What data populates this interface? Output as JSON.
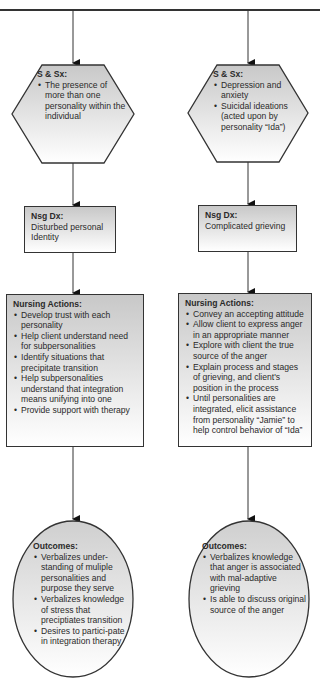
{
  "diagram": {
    "type": "flowchart",
    "columns": [
      {
        "id": "left",
        "symptoms": {
          "title": "S & Sx:",
          "items": [
            "The presence of more than one personality within the individual"
          ]
        },
        "diagnosis": {
          "title": "Nsg Dx:",
          "text": "Disturbed personal Identity"
        },
        "actions": {
          "title": "Nursing Actions:",
          "items": [
            "Develop trust with each personality",
            "Help client understand need for subpersonalities",
            "Identify situations that precipitate transition",
            "Help subpersonalities understand that integration means unifying into one",
            "Provide support with therapy"
          ]
        },
        "outcomes": {
          "title": "Outcomes:",
          "items": [
            "Verbalizes under-standing of muliple personalities and purpose they serve",
            "Verbalizes knowledge of stress that preciptiates transition",
            "Desires to partici-pate in integration therapy"
          ]
        }
      },
      {
        "id": "right",
        "symptoms": {
          "title": "S & Sx:",
          "items": [
            "Depression and anxiety",
            "Suicidal ideations (acted upon by personality “Ida”)"
          ]
        },
        "diagnosis": {
          "title": "Nsg Dx:",
          "text": "Complicated grieving"
        },
        "actions": {
          "title": "Nursing Actions:",
          "items": [
            "Convey an accepting attitude",
            "Allow client to express anger in an appropriate manner",
            "Explore with client the true source of the anger",
            "Explain process and stages of grieving, and client's position in the process",
            "Until personalities are integrated, elicit assistance from personality “Jamie” to help control behavior of “Ida”"
          ]
        },
        "outcomes": {
          "title": "Outcomes:",
          "items": [
            "Verbalizes knowledge that anger is associated with mal-adaptive grieving",
            "Is able to discuss original source of the anger"
          ]
        }
      }
    ],
    "colors": {
      "stroke": "#333333",
      "fill_top": "#c8c8c8",
      "fill_bottom": "#ffffff"
    }
  }
}
